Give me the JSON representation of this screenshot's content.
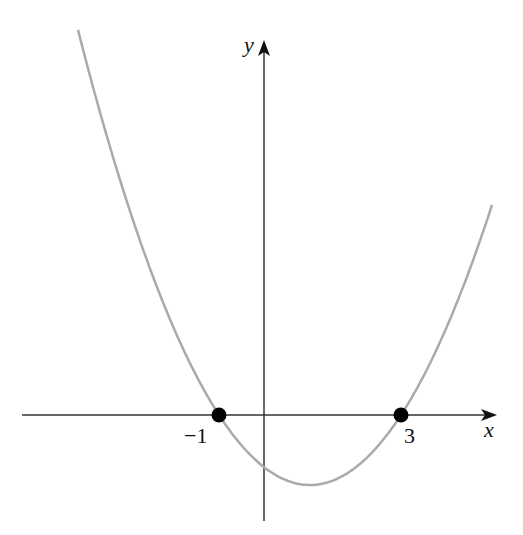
{
  "chart_data": {
    "type": "line",
    "title": "",
    "xlabel": "x",
    "ylabel": "y",
    "function": "y = (x + 1)(x - 3)",
    "series": [
      {
        "name": "parabola",
        "color": "#aaaaaa",
        "x_range": [
          -4.1,
          5.0
        ]
      }
    ],
    "points": [
      {
        "x": -1,
        "y": 0,
        "label": "−1"
      },
      {
        "x": 3,
        "y": 0,
        "label": "3"
      }
    ],
    "vertex": {
      "x": 1,
      "y": -4
    },
    "y_intercept": -3,
    "tick_labels": [
      "−1",
      "3"
    ],
    "grid": false,
    "legend": null
  },
  "labels": {
    "x_axis": "x",
    "y_axis": "y",
    "root_left": "−1",
    "root_right": "3"
  },
  "colors": {
    "curve": "#aaaaaa",
    "axes": "#222222",
    "points": "#000000"
  }
}
